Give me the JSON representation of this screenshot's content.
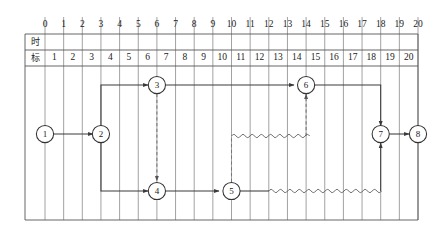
{
  "diagram": {
    "header_label": "时标",
    "axis": {
      "top_ticks": [
        "0",
        "1",
        "2",
        "3",
        "4",
        "5",
        "6",
        "7",
        "8",
        "9",
        "10",
        "11",
        "12",
        "13",
        "14",
        "15",
        "16",
        "17",
        "18",
        "19",
        "20"
      ],
      "row_cells": [
        "1",
        "2",
        "3",
        "4",
        "5",
        "6",
        "7",
        "8",
        "9",
        "10",
        "11",
        "12",
        "13",
        "14",
        "15",
        "16",
        "17",
        "18",
        "19",
        "20"
      ],
      "min": 0,
      "max": 20
    },
    "colors": {
      "grid": "#8a8a8a",
      "frame": "#555555",
      "solid_line": "#3a3a3a",
      "dashed_line": "#777777",
      "wavy_line": "#555555",
      "node_fill": "#ffffff",
      "node_stroke": "#333333",
      "background": "#ffffff"
    },
    "nodes": [
      {
        "id": "1",
        "label": "1",
        "t": 0,
        "row": "middle"
      },
      {
        "id": "2",
        "label": "2",
        "t": 3,
        "row": "middle"
      },
      {
        "id": "3",
        "label": "3",
        "t": 6,
        "row": "top"
      },
      {
        "id": "4",
        "label": "4",
        "t": 6,
        "row": "bottom"
      },
      {
        "id": "5",
        "label": "5",
        "t": 10,
        "row": "bottom"
      },
      {
        "id": "6",
        "label": "6",
        "t": 14,
        "row": "top"
      },
      {
        "id": "7",
        "label": "7",
        "t": 18,
        "row": "middle"
      },
      {
        "id": "8",
        "label": "8",
        "t": 20,
        "row": "middle"
      }
    ],
    "arrows": [
      {
        "from": "1",
        "to": "2",
        "style": "solid",
        "kind": "work"
      },
      {
        "from": "2",
        "to": "3",
        "style": "solid",
        "kind": "work"
      },
      {
        "from": "2",
        "to": "4",
        "style": "solid",
        "kind": "work"
      },
      {
        "from": "3",
        "to": "4",
        "style": "dashed",
        "kind": "virtual"
      },
      {
        "from": "3",
        "to": "6",
        "style": "solid",
        "kind": "work"
      },
      {
        "from": "4",
        "to": "5",
        "style": "solid",
        "kind": "work"
      },
      {
        "from": "5",
        "to": "6",
        "style": "dashed",
        "kind": "virtual"
      },
      {
        "from": "5",
        "to": "7",
        "style": "solid",
        "kind": "work"
      },
      {
        "from": "6",
        "to": "7",
        "style": "solid",
        "kind": "work"
      },
      {
        "from": "7",
        "to": "8",
        "style": "solid",
        "kind": "work"
      }
    ],
    "float_bars": [
      {
        "label": "float-5-to-6",
        "from_t": 10,
        "to_t": 14,
        "row": "float-upper"
      },
      {
        "label": "float-5-to-7",
        "from_t": 12,
        "to_t": 18,
        "row": "bottom"
      }
    ]
  }
}
